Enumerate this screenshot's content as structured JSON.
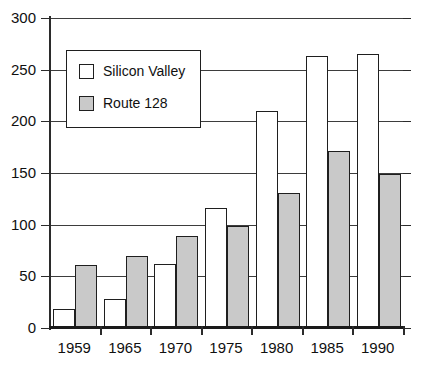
{
  "chart_data": {
    "type": "bar",
    "title": "",
    "subtitle": "",
    "xlabel": "",
    "ylabel": "",
    "categories": [
      "1959",
      "1965",
      "1970",
      "1975",
      "1980",
      "1985",
      "1990"
    ],
    "series": [
      {
        "name": "Silicon  Valley",
        "color": "#ffffff",
        "values": [
          18,
          28,
          62,
          116,
          210,
          263,
          265
        ]
      },
      {
        "name": "Route  128",
        "color": "#c9c9c9",
        "values": [
          61,
          70,
          89,
          99,
          131,
          171,
          149
        ]
      }
    ],
    "ylim": [
      0,
      300
    ],
    "yticks": [
      0,
      50,
      100,
      150,
      200,
      250,
      300
    ],
    "ytick_labels": [
      "0",
      "50",
      "100",
      "150",
      "200",
      "250",
      "300"
    ],
    "grid": true,
    "legend_position": "upper-left-inside",
    "annotations": []
  },
  "legend": {
    "entries": [
      {
        "label": "Silicon  Valley",
        "swatch": "white-square"
      },
      {
        "label": "Route  128",
        "swatch": "gray-square"
      }
    ]
  }
}
